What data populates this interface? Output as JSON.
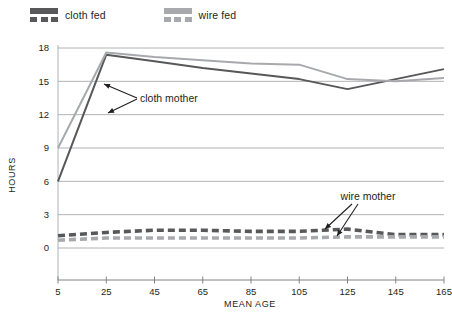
{
  "legend": {
    "entries": [
      {
        "label": "cloth fed",
        "color": "#58585a",
        "swatch": "line-swatch"
      },
      {
        "label": "wire fed",
        "color": "#a7a9ac",
        "swatch": "line-swatch"
      }
    ]
  },
  "annotations": [
    {
      "label": "cloth mother"
    },
    {
      "label": "wire mother"
    }
  ],
  "chart_data": {
    "type": "line",
    "title": "",
    "xlabel": "MEAN AGE",
    "ylabel": "HOURS",
    "x": [
      5,
      25,
      45,
      65,
      85,
      105,
      125,
      145,
      165
    ],
    "xticklabels": [
      "5",
      "25",
      "45",
      "65",
      "85",
      "105",
      "125",
      "145",
      "165"
    ],
    "yticklabels": [
      "0",
      "3",
      "6",
      "9",
      "12",
      "15",
      "18"
    ],
    "xlim": [
      5,
      165
    ],
    "ylim": [
      0,
      18
    ],
    "grid": true,
    "legend_position": "top-left",
    "series": [
      {
        "name": "cloth fed — cloth mother",
        "group": "cloth mother",
        "feeding": "cloth fed",
        "color": "#58585a",
        "style": "solid",
        "values": [
          6.0,
          17.4,
          16.8,
          16.2,
          15.7,
          15.2,
          14.3,
          15.2,
          16.1
        ]
      },
      {
        "name": "wire fed — cloth mother",
        "group": "cloth mother",
        "feeding": "wire fed",
        "color": "#a7a9ac",
        "style": "solid",
        "values": [
          9.0,
          17.6,
          17.2,
          16.9,
          16.6,
          16.5,
          15.2,
          15.0,
          15.3
        ]
      },
      {
        "name": "cloth fed — wire mother",
        "group": "wire mother",
        "feeding": "cloth fed",
        "color": "#58585a",
        "style": "dashed",
        "values": [
          1.1,
          1.4,
          1.6,
          1.6,
          1.5,
          1.5,
          1.7,
          1.2,
          1.2
        ]
      },
      {
        "name": "wire fed — wire mother",
        "group": "wire mother",
        "feeding": "wire fed",
        "color": "#a7a9ac",
        "style": "dashed",
        "values": [
          0.7,
          0.9,
          0.9,
          0.9,
          0.9,
          0.9,
          1.0,
          1.0,
          1.0
        ]
      }
    ]
  }
}
